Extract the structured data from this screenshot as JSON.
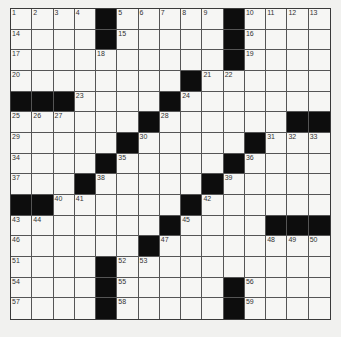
{
  "puzzle": {
    "rows": 15,
    "cols": 15,
    "colors": {
      "background": "#f1f1ef",
      "cell": "#f6f6f4",
      "block": "#0d0d0d",
      "gridline": "#555555"
    },
    "grid": [
      [
        "1",
        "2",
        "3",
        "4",
        "#",
        "5",
        "6",
        "7",
        "8",
        "9",
        "#",
        "10",
        "11",
        "12",
        "13"
      ],
      [
        "14",
        "",
        "",
        "",
        "#",
        "15",
        "",
        "",
        "",
        "",
        "#",
        "16",
        "",
        "",
        ""
      ],
      [
        "17",
        "",
        "",
        "",
        "18",
        "",
        "",
        "",
        "",
        "",
        "#",
        "19",
        "",
        "",
        ""
      ],
      [
        "20",
        "",
        "",
        "",
        "",
        "",
        "",
        "",
        "#",
        "21",
        "22",
        "",
        "",
        "",
        ""
      ],
      [
        "#",
        "#",
        "#",
        "23",
        "",
        "",
        "",
        "#",
        "24",
        "",
        "",
        "",
        "",
        "",
        ""
      ],
      [
        "25",
        "26",
        "27",
        "",
        "",
        "",
        "#",
        "28",
        "",
        "",
        "",
        "",
        "",
        "#",
        "#"
      ],
      [
        "29",
        "",
        "",
        "",
        "",
        "#",
        "30",
        "",
        "",
        "",
        "",
        "#",
        "31",
        "32",
        "33"
      ],
      [
        "34",
        "",
        "",
        "",
        "#",
        "35",
        "",
        "",
        "",
        "",
        "#",
        "36",
        "",
        "",
        ""
      ],
      [
        "37",
        "",
        "",
        "#",
        "38",
        "",
        "",
        "",
        "",
        "#",
        "39",
        "",
        "",
        "",
        ""
      ],
      [
        "#",
        "#",
        "40",
        "41",
        "",
        "",
        "",
        "",
        "#",
        "42",
        "",
        "",
        "",
        "",
        ""
      ],
      [
        "43",
        "44",
        "",
        "",
        "",
        "",
        "",
        "#",
        "45",
        "",
        "",
        "",
        "#",
        "#",
        "#"
      ],
      [
        "46",
        "",
        "",
        "",
        "",
        "",
        "#",
        "47",
        "",
        "",
        "",
        "",
        "48",
        "49",
        "50"
      ],
      [
        "51",
        "",
        "",
        "",
        "#",
        "52",
        "53",
        "",
        "",
        "",
        "",
        "",
        "",
        "",
        ""
      ],
      [
        "54",
        "",
        "",
        "",
        "#",
        "55",
        "",
        "",
        "",
        "",
        "#",
        "56",
        "",
        "",
        ""
      ],
      [
        "57",
        "",
        "",
        "",
        "#",
        "58",
        "",
        "",
        "",
        "",
        "#",
        "59",
        "",
        "",
        ""
      ]
    ]
  }
}
